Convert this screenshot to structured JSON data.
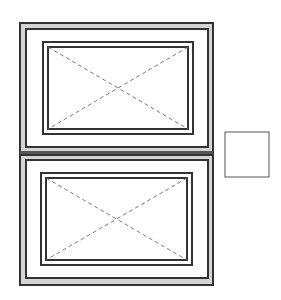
{
  "drawing": {
    "type": "window-elevation",
    "colors": {
      "background": "#ffffff",
      "frame_line": "#333333",
      "frame_hatch": "#d4d4d4",
      "swing_indicator": "#6a6a6a",
      "detail_box": "#555555"
    },
    "units": [
      {
        "name": "upper-window",
        "frame": {
          "x": 20,
          "y": 23,
          "w": 193,
          "h": 132
        },
        "frame_inner": {
          "x": 26,
          "y": 29,
          "w": 182,
          "h": 118
        },
        "sash": {
          "x": 43,
          "y": 42,
          "w": 150,
          "h": 92
        },
        "glass": {
          "x": 48,
          "y": 47,
          "w": 140,
          "h": 82
        }
      },
      {
        "name": "lower-window",
        "frame": {
          "x": 20,
          "y": 155,
          "w": 193,
          "h": 130
        },
        "frame_inner": {
          "x": 26,
          "y": 160,
          "w": 182,
          "h": 118
        },
        "sash": {
          "x": 41,
          "y": 173,
          "w": 151,
          "h": 92
        },
        "glass": {
          "x": 46,
          "y": 178,
          "w": 141,
          "h": 82
        }
      }
    ],
    "detail_box": {
      "x": 225,
      "y": 132,
      "w": 44,
      "h": 45
    }
  }
}
